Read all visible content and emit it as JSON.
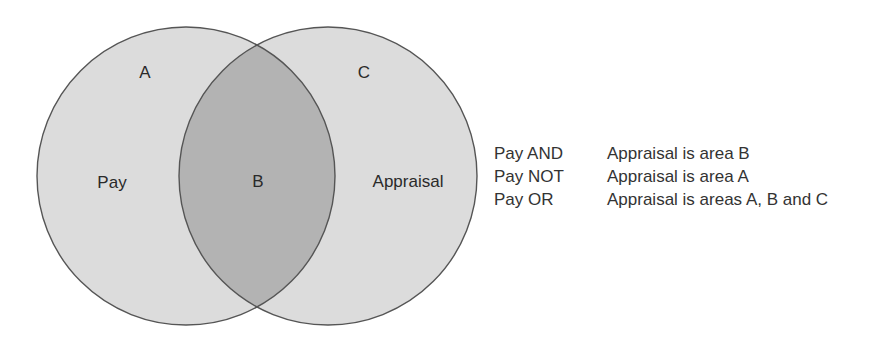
{
  "diagram": {
    "type": "venn",
    "colors": {
      "circle_fill": "#dcdcdc",
      "intersection_fill": "#b3b3b3",
      "stroke": "#555555"
    },
    "sets": [
      {
        "name": "Pay",
        "region_label": "A"
      },
      {
        "name": "Appraisal",
        "region_label": "C"
      }
    ],
    "intersection_label": "B",
    "labels": {
      "a": "A",
      "b": "B",
      "c": "C",
      "pay": "Pay",
      "appraisal": "Appraisal"
    }
  },
  "legend": [
    {
      "operator": "Pay AND",
      "description": "Appraisal is area B"
    },
    {
      "operator": "Pay NOT",
      "description": "Appraisal is area A"
    },
    {
      "operator": "Pay OR",
      "description": "Appraisal is areas A, B and C"
    }
  ]
}
